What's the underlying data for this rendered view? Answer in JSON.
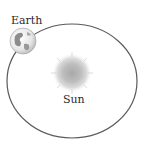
{
  "diagram": {
    "labels": {
      "earth": "Earth",
      "sun": "Sun"
    },
    "orbit": {
      "cx": 72,
      "cy": 81,
      "rx": 65,
      "ry": 57,
      "stroke": "#5a5a5a"
    },
    "sun": {
      "cx": 72,
      "cy": 73,
      "r": 19,
      "color": "#b8b8b8"
    },
    "earth": {
      "cx": 23,
      "cy": 41,
      "r": 13,
      "ocean_color": "#f2f2f2",
      "land_color": "#8c8c8c"
    }
  }
}
